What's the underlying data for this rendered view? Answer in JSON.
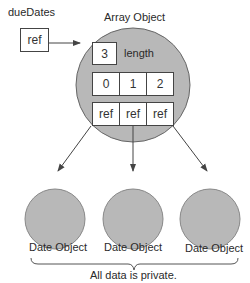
{
  "variable": {
    "name": "dueDates",
    "value": "ref"
  },
  "array_object": {
    "title": "Array Object",
    "length_value": "3",
    "length_label": "length",
    "indices": [
      "0",
      "1",
      "2"
    ],
    "refs": [
      "ref",
      "ref",
      "ref"
    ]
  },
  "date_objects": [
    {
      "label": "Date Object"
    },
    {
      "label": "Date Object"
    },
    {
      "label": "Date Object"
    }
  ],
  "caption": "All data is private.",
  "colors": {
    "circle_fill": "#b8b8b8",
    "stroke": "#555555"
  }
}
